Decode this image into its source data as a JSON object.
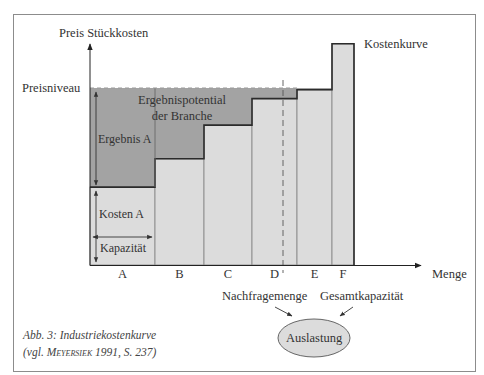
{
  "figure": {
    "y_axis_label": "Preis Stückkosten",
    "x_axis_label": "Menge",
    "price_level_label": "Preisniveau",
    "curve_label": "Kostenkurve",
    "potential_label_line1": "Ergebnispotential",
    "potential_label_line2": "der Branche",
    "result_a_label": "Ergebnis A",
    "cost_a_label": "Kosten A",
    "capacity_label": "Kapazität",
    "demand_label": "Nachfragemenge",
    "total_capacity_label": "Gesamtkapazität",
    "utilization_label": "Auslastung",
    "caption": {
      "line1": "Abb. 3: Industriekostenkurve",
      "line2_prefix": "(vgl. ",
      "author": "Meyersiek",
      "line2_suffix": " 1991, S. 237)"
    }
  },
  "colors": {
    "result_fill": "#a3a3a3",
    "cost_fill": "#dcdcdc",
    "step_line": "#2b2b2b",
    "bar_outline": "#8a8a8a",
    "ellipse_fill": "#dcdcdc"
  },
  "chart_data": {
    "type": "bar",
    "subtype": "variable-width step cost curve",
    "title": "Industriekostenkurve",
    "xlabel": "Menge",
    "ylabel": "Preis Stückkosten",
    "units": "relative (Preisniveau = 100), capacities relative",
    "categories": [
      "A",
      "B",
      "C",
      "D",
      "E",
      "F"
    ],
    "values": [
      44,
      60,
      79,
      94,
      99,
      125
    ],
    "widths": [
      65,
      49,
      48,
      45,
      35,
      22
    ],
    "price_level": 100,
    "price_level_label": "Preisniveau",
    "demand_quantity": 193,
    "demand_label": "Nachfragemenge",
    "curve_label": "Kostenkurve",
    "grid": false,
    "annotations": [
      "Ergebnispotential der Branche",
      "Ergebnis A",
      "Kosten A",
      "Kapazität",
      "Nachfragemenge + Gesamtkapazität → Auslastung"
    ]
  }
}
